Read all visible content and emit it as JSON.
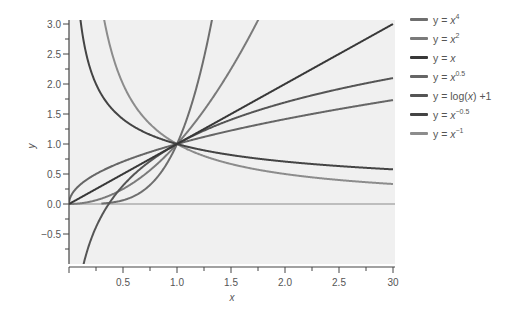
{
  "chart_data": {
    "type": "line",
    "title": "",
    "xlabel": "x",
    "ylabel": "y",
    "xlim": [
      0,
      3
    ],
    "ylim": [
      -1,
      3
    ],
    "grid": false,
    "legend_position": "right",
    "x_ticks": [
      0,
      0.25,
      0.5,
      0.75,
      1.0,
      1.25,
      1.5,
      1.75,
      2.0,
      2.25,
      2.5,
      2.75,
      3.0
    ],
    "x_tick_labels": [
      {
        "value": 0.5,
        "label": "0.5"
      },
      {
        "value": 1.0,
        "label": "1.0"
      },
      {
        "value": 1.5,
        "label": "1.5"
      },
      {
        "value": 2.0,
        "label": "2.0"
      },
      {
        "value": 2.5,
        "label": "2.5"
      },
      {
        "value": 3.0,
        "label": "30"
      }
    ],
    "y_ticks": [
      -0.75,
      -0.5,
      -0.25,
      0,
      0.25,
      0.5,
      0.75,
      1.0,
      1.25,
      1.5,
      1.75,
      2.0,
      2.25,
      2.5,
      2.75,
      3.0
    ],
    "y_tick_labels": [
      {
        "value": 3.0,
        "label": "3.0"
      },
      {
        "value": 2.5,
        "label": "2.5"
      },
      {
        "value": 2.0,
        "label": "2.0"
      },
      {
        "value": 1.5,
        "label": "1.5"
      },
      {
        "value": 1.0,
        "label": "1.0"
      },
      {
        "value": 0.5,
        "label": "0.5"
      },
      {
        "value": 0.0,
        "label": "0.0"
      },
      {
        "value": -0.5,
        "label": "−0.5"
      }
    ],
    "reference_lines": [
      {
        "axis": "y",
        "value": 0
      }
    ],
    "series": [
      {
        "name": "y = x^4",
        "fn": "pow4",
        "color": "#6e6e6e",
        "x": [
          0,
          0.25,
          0.5,
          0.75,
          1.0,
          1.25,
          1.32
        ],
        "y": [
          0,
          0.004,
          0.0625,
          0.316,
          1.0,
          2.44,
          3.0
        ]
      },
      {
        "name": "y = x^2",
        "fn": "pow2",
        "color": "#7a7a7a",
        "x": [
          0,
          0.25,
          0.5,
          0.75,
          1.0,
          1.25,
          1.5,
          1.73
        ],
        "y": [
          0,
          0.0625,
          0.25,
          0.5625,
          1.0,
          1.5625,
          2.25,
          3.0
        ]
      },
      {
        "name": "y = x",
        "fn": "lin",
        "color": "#383838",
        "x": [
          0,
          1,
          2,
          3
        ],
        "y": [
          0,
          1,
          2,
          3
        ]
      },
      {
        "name": "y = x^0.5",
        "fn": "sqrt",
        "color": "#666666",
        "x": [
          0,
          0.25,
          0.5,
          1.0,
          2.0,
          3.0
        ],
        "y": [
          0,
          0.5,
          0.707,
          1.0,
          1.414,
          1.732
        ]
      },
      {
        "name": "y = log(x) +1",
        "fn": "log",
        "color": "#555555",
        "x": [
          0.14,
          0.25,
          0.5,
          1.0,
          2.0,
          3.0
        ],
        "y": [
          -0.97,
          -0.386,
          0.307,
          1.0,
          1.693,
          2.099
        ]
      },
      {
        "name": "y = x^-0.5",
        "fn": "invsqrt",
        "color": "#444444",
        "x": [
          0.11,
          0.25,
          0.5,
          1.0,
          2.0,
          3.0
        ],
        "y": [
          3.0,
          2.0,
          1.414,
          1.0,
          0.707,
          0.577
        ]
      },
      {
        "name": "y = x^-1",
        "fn": "inv",
        "color": "#8c8c8c",
        "x": [
          0.33,
          0.5,
          1.0,
          2.0,
          3.0
        ],
        "y": [
          3.0,
          2.0,
          1.0,
          0.5,
          0.333
        ]
      }
    ]
  },
  "legend": [
    {
      "base": "y = ",
      "var": "x",
      "exp": "4",
      "suffix": "",
      "color": "#6e6e6e"
    },
    {
      "base": "y = ",
      "var": "x",
      "exp": "2",
      "suffix": "",
      "color": "#7a7a7a"
    },
    {
      "base": "y = ",
      "var": "x",
      "exp": "",
      "suffix": "",
      "color": "#383838"
    },
    {
      "base": "y = ",
      "var": "x",
      "exp": "0.5",
      "suffix": "",
      "color": "#666666"
    },
    {
      "base": "y = log(",
      "var": "x",
      "exp": "",
      "suffix": ") +1",
      "color": "#555555"
    },
    {
      "base": "y = ",
      "var": "x",
      "exp": "−0.5",
      "suffix": "",
      "color": "#444444"
    },
    {
      "base": "y = ",
      "var": "x",
      "exp": "−1",
      "suffix": "",
      "color": "#8c8c8c"
    }
  ],
  "style": {
    "plot_background": "#f0f0f0",
    "axis_color": "#444444",
    "zero_line_color": "#8a8a8a"
  }
}
